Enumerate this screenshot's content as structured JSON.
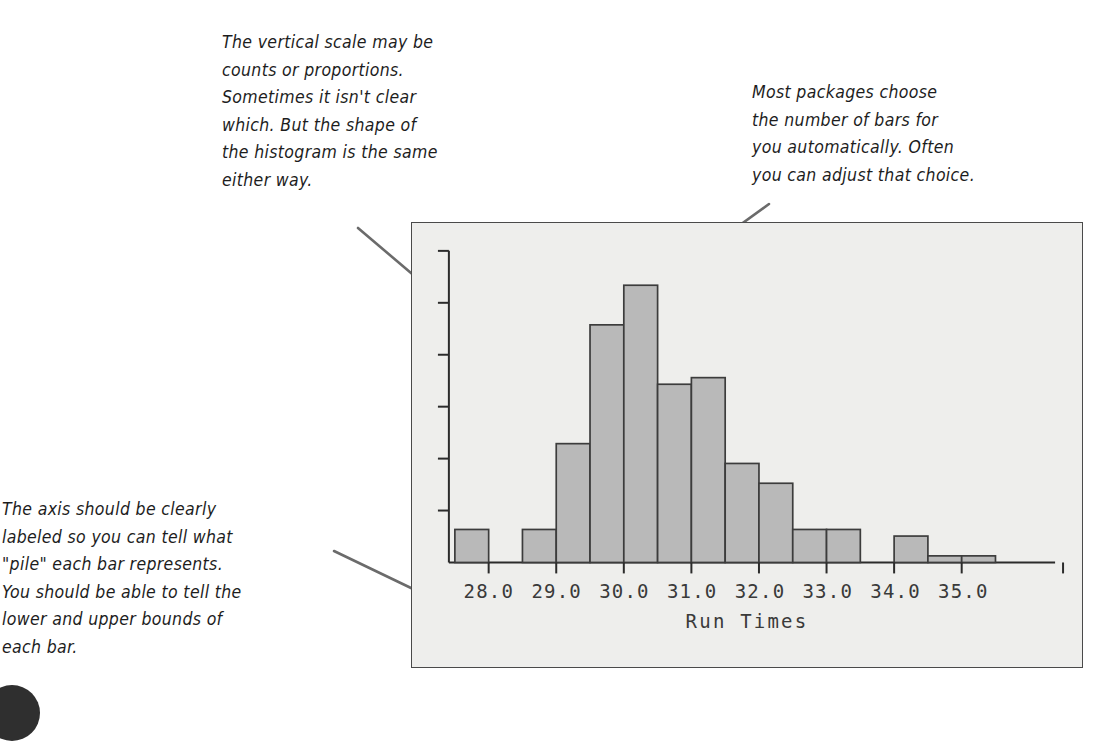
{
  "annotations": [
    {
      "id": "vertical-scale",
      "name": "annotation-vertical-scale",
      "text": "The vertical scale may be\ncounts or proportions.\nSometimes it isn't clear\nwhich. But the shape of\nthe histogram is the same\neither way."
    },
    {
      "id": "number-of-bars",
      "name": "annotation-number-of-bars",
      "text": "Most packages choose\nthe number of bars for\nyou automatically. Often\nyou can adjust that choice."
    },
    {
      "id": "axis-label",
      "name": "annotation-axis-label",
      "text": "The axis should be clearly\nlabeled so you can tell what\n\"pile\" each bar represents.\nYou should be able to tell the\nlower and upper bounds of\neach bar."
    }
  ],
  "leader_lines": [
    {
      "name": "leader-line-vertical-scale",
      "x1": 358,
      "y1": 228,
      "x2": 444,
      "y2": 301
    },
    {
      "name": "leader-line-number-of-bars",
      "x1": 769,
      "y1": 204,
      "x2": 675,
      "y2": 272
    },
    {
      "name": "leader-line-axis-label",
      "x1": 334,
      "y1": 551,
      "x2": 461,
      "y2": 612
    }
  ],
  "colors": {
    "bar_fill": "#b9b9b9",
    "bar_stroke": "#3c3c3c",
    "axis": "#2b2b2b",
    "frame_border": "#4a4a4a",
    "plot_background": "#eeeeec",
    "text": "#3a3a3a",
    "annotation_text": "#1d1d1d",
    "leader_line": "#6b6b6b"
  },
  "chart_data": {
    "type": "bar",
    "title": "",
    "subtitle": "",
    "xlabel": "Run Times",
    "ylabel": "",
    "grid": false,
    "legend": "none",
    "xtick_labels": [
      "28.0",
      "29.0",
      "30.0",
      "31.0",
      "32.0",
      "33.0",
      "34.0",
      "35.0"
    ],
    "xtick_values": [
      28.0,
      29.0,
      30.0,
      31.0,
      32.0,
      33.0,
      34.0,
      35.0
    ],
    "ytick_labels": [],
    "ytick_count": 5,
    "xlim": [
      27.5,
      36.5
    ],
    "ylim": [
      0,
      46
    ],
    "bin_width": 0.5,
    "bin_edges": [
      27.5,
      28.0,
      28.5,
      29.0,
      29.5,
      30.0,
      30.5,
      31.0,
      31.5,
      32.0,
      32.5,
      33.0,
      33.5,
      34.0,
      34.5,
      35.0,
      35.5
    ],
    "categories": [
      "27.5-28.0",
      "28.0-28.5",
      "28.5-29.0",
      "29.0-29.5",
      "29.5-30.0",
      "30.0-30.5",
      "30.5-31.0",
      "31.0-31.5",
      "31.5-32.0",
      "32.0-32.5",
      "32.5-33.0",
      "33.0-33.5",
      "33.5-34.0",
      "34.0-34.5",
      "34.5-35.0",
      "35.0-35.5"
    ],
    "values": [
      5,
      0,
      5,
      18,
      36,
      42,
      27,
      28,
      15,
      12,
      5,
      5,
      0,
      4,
      1,
      1
    ]
  }
}
